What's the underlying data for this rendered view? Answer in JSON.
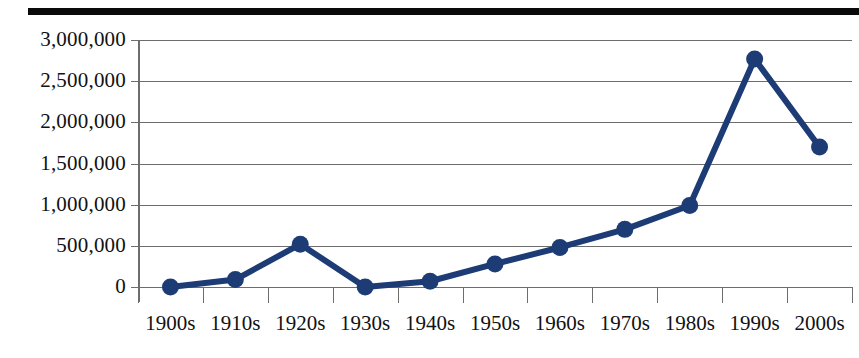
{
  "chart_data": {
    "type": "line",
    "title": "",
    "subtitle": "",
    "xlabel": "",
    "ylabel": "",
    "categories": [
      "1900s",
      "1910s",
      "1920s",
      "1930s",
      "1940s",
      "1950s",
      "1960s",
      "1970s",
      "1980s",
      "1990s",
      "2000s"
    ],
    "values": [
      0,
      90000,
      520000,
      0,
      70000,
      280000,
      480000,
      700000,
      990000,
      2770000,
      1700000
    ],
    "series": [
      {
        "name": "",
        "values": [
          0,
          90000,
          520000,
          0,
          70000,
          280000,
          480000,
          700000,
          990000,
          2770000,
          1700000
        ]
      }
    ],
    "ylim": [
      0,
      3000000
    ],
    "ytick_values": [
      0,
      500000,
      1000000,
      1500000,
      2000000,
      2500000,
      3000000
    ],
    "ytick_labels": [
      "0",
      "500,000",
      "1,000,000",
      "1,500,000",
      "2,000,000",
      "2,500,000",
      "3,000,000"
    ],
    "grid": true,
    "legend": "none",
    "marker": "circle",
    "line_color": "#1d3c76",
    "marker_color": "#1d3c76",
    "gridline_color": "#6d6d6d",
    "axis_color": "#6d6d6d",
    "rule_color": "#0a0a0a",
    "background_color": "#ffffff"
  }
}
